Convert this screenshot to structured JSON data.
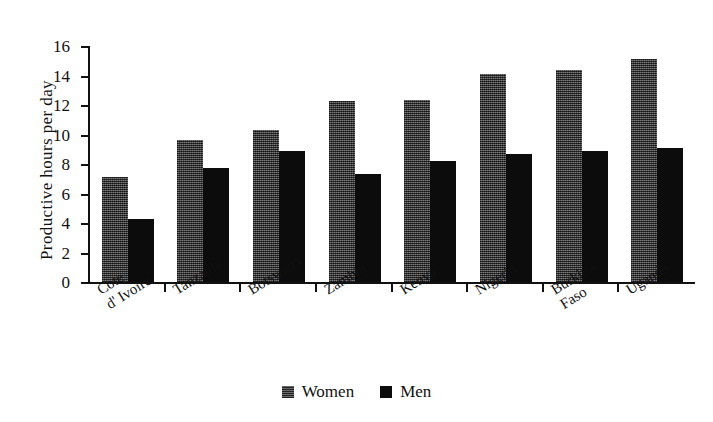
{
  "chart_data": {
    "type": "bar",
    "title": "",
    "subtitle": "",
    "xlabel": "",
    "ylabel": "Productive hours per day",
    "ylim": [
      0,
      16
    ],
    "ytick_step": 2,
    "yticks": [
      "16",
      "14",
      "12",
      "10",
      "8",
      "6",
      "4",
      "2",
      "0"
    ],
    "grid": false,
    "legend_position": "bottom-center",
    "categories": [
      "Cote d' Ivoire",
      "Tanzania",
      "Botswana",
      "Zambia",
      "Kenya",
      "Nigeria",
      "Burkina Faso",
      "Uganda"
    ],
    "category_lines": [
      [
        "Cote",
        "d' Ivoire"
      ],
      [
        "Tanzania",
        ""
      ],
      [
        "Botswana",
        ""
      ],
      [
        "Zambia",
        ""
      ],
      [
        "Kenya",
        ""
      ],
      [
        "Nigeria",
        ""
      ],
      [
        "Burkina",
        "Faso"
      ],
      [
        "Uganda",
        ""
      ]
    ],
    "series": [
      {
        "name": "Women",
        "color": "#4d4d4d",
        "values": [
          7.1,
          9.6,
          10.3,
          12.3,
          12.35,
          14.1,
          14.4,
          15.15
        ]
      },
      {
        "name": "Men",
        "color": "#0c0c0c",
        "values": [
          4.3,
          7.7,
          8.9,
          7.35,
          8.2,
          8.65,
          8.85,
          9.1
        ]
      }
    ]
  },
  "legend": {
    "items": [
      {
        "label": "Women",
        "color": "#4d4d4d"
      },
      {
        "label": "Men",
        "color": "#0c0c0c"
      }
    ]
  }
}
